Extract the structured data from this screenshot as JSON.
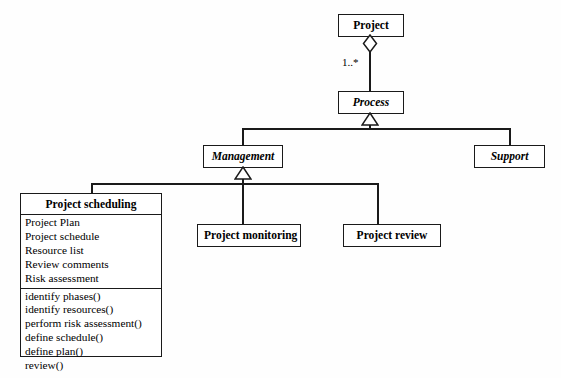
{
  "diagram": {
    "type": "uml-class-diagram",
    "background_color": "#fefefe",
    "line_color": "#1a1a1a",
    "classes": [
      {
        "id": "project",
        "name": "Project",
        "abstract": false,
        "attributes": [],
        "operations": []
      },
      {
        "id": "process",
        "name": "Process",
        "abstract": true,
        "attributes": [],
        "operations": []
      },
      {
        "id": "management",
        "name": "Management",
        "abstract": true,
        "attributes": [],
        "operations": []
      },
      {
        "id": "support",
        "name": "Support",
        "abstract": true,
        "attributes": [],
        "operations": []
      },
      {
        "id": "project-scheduling",
        "name": "Project scheduling",
        "abstract": false,
        "attributes": [
          "Project Plan",
          "Project schedule",
          "Resource list",
          "Review comments",
          "Risk assessment"
        ],
        "operations": [
          "identify phases()",
          "identify resources()",
          "perform risk assessment()",
          "define schedule()",
          "define plan()",
          "review()"
        ]
      },
      {
        "id": "project-monitoring",
        "name": "Project monitoring",
        "abstract": false,
        "attributes": [],
        "operations": []
      },
      {
        "id": "project-review",
        "name": "Project review",
        "abstract": false,
        "attributes": [],
        "operations": []
      }
    ],
    "relationships": [
      {
        "kind": "aggregation",
        "from": "project",
        "to": "process",
        "multiplicity": "1..*",
        "marker": "hollow-diamond"
      },
      {
        "kind": "generalization",
        "from": "management",
        "to": "process",
        "marker": "hollow-triangle"
      },
      {
        "kind": "generalization",
        "from": "support",
        "to": "process",
        "marker": "hollow-triangle"
      },
      {
        "kind": "generalization",
        "from": "project-scheduling",
        "to": "management",
        "marker": "hollow-triangle"
      },
      {
        "kind": "generalization",
        "from": "project-monitoring",
        "to": "management",
        "marker": "hollow-triangle"
      },
      {
        "kind": "generalization",
        "from": "project-review",
        "to": "management",
        "marker": "hollow-triangle"
      }
    ]
  }
}
